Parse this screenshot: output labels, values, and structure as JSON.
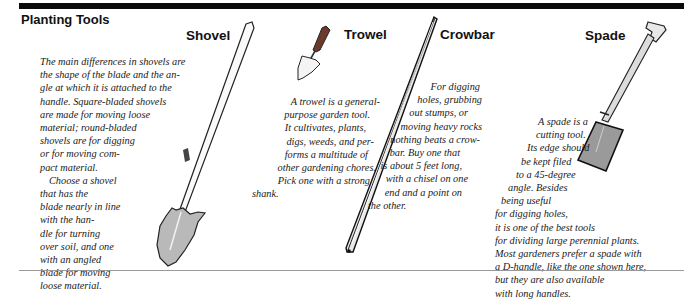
{
  "section_title": "Planting Tools",
  "tools": {
    "shovel": {
      "name": "Shovel",
      "lines": [
        "The main differences in shovels are",
        "the shape of the blade and the an-",
        "gle at which it is attached to the",
        "handle. Square-bladed shovels",
        "are made for moving loose",
        "material; round-bladed",
        "shovels are for digging",
        "or for moving com-",
        "pact material.",
        "    Choose a shovel",
        "that has the",
        "blade nearly in line",
        "with the han-",
        "dle for turning",
        "over soil, and one",
        "with an angled",
        "blade for moving",
        "loose material."
      ]
    },
    "trowel": {
      "name": "Trowel",
      "lines": [
        "A trowel is a general-",
        "purpose garden tool.",
        "It cultivates, plants,",
        "digs, weeds, and per-",
        "forms a multitude of",
        "other gardening chores.",
        "Pick one with a strong",
        "shank."
      ]
    },
    "crowbar": {
      "name": "Crowbar",
      "lines": [
        "For digging",
        "holes, grubbing",
        "out stumps, or",
        "moving heavy rocks",
        "nothing beats a crow-",
        "bar. Buy one that",
        "is about 5 feet long,",
        "with a chisel on one",
        "end and a point on",
        "the other."
      ]
    },
    "spade": {
      "name": "Spade",
      "lines": [
        "A spade is a",
        "cutting tool.",
        "Its edge should",
        "be kept filed",
        "to a 45-degree",
        "angle. Besides",
        "being useful",
        "for digging holes,",
        "it is one of the best tools",
        "for dividing large perennial plants.",
        "Most gardeners prefer a spade with",
        "a D-handle, like the one shown here,",
        "but they are also available",
        "with long handles."
      ]
    }
  }
}
